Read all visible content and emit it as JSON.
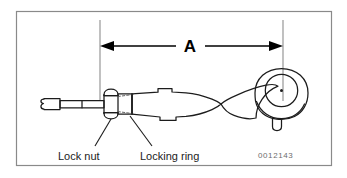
{
  "figure": {
    "part_number": "0012143",
    "dimension_label": "A",
    "callouts": [
      {
        "id": "lock-nut",
        "label": "Lock nut"
      },
      {
        "id": "locking-ring",
        "label": "Locking ring"
      }
    ],
    "colors": {
      "background": "#ffffff",
      "frame_border": "#8a8a8a",
      "line": "#1c1c1c",
      "dimension_arrow": "#000000",
      "label_text": "#1c1c1c",
      "part_number_text": "#6d6d6d",
      "hidden_line": "#555555"
    },
    "frame": {
      "x": 16,
      "y": 11,
      "width": 316,
      "height": 155
    },
    "dimension": {
      "from_x": 100,
      "to_x": 283,
      "line_y": 46,
      "extension_top_y": 20,
      "extension_left_bottom_y": 101,
      "extension_right_bottom_y": 101,
      "description": "Span A measured from lock nut face plane to ball joint stud centre"
    },
    "components": [
      {
        "id": "threaded-shank",
        "name": "Threaded shank with break symbol"
      },
      {
        "id": "hex-lock-nut",
        "name": "Hex lock nut"
      },
      {
        "id": "locking-ring-collar",
        "name": "Locking ring collar"
      },
      {
        "id": "tie-rod-body",
        "name": "Forged tie rod body with wrench flats"
      },
      {
        "id": "ball-joint-housing",
        "name": "Ball joint housing"
      },
      {
        "id": "stud-centre",
        "name": "Ball stud centre point"
      },
      {
        "id": "grease-fitting",
        "name": "Grease fitting / stud boss"
      }
    ]
  }
}
